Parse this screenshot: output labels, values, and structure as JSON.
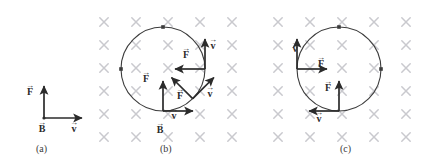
{
  "figure": {
    "colors": {
      "field_mark": "#c9c9ce",
      "vector": "#2b2b2b",
      "circle": "#3c3c3c",
      "caption": "#3a3a3a",
      "background": "#ffffff"
    },
    "field_symbol": "field-into-page-x",
    "grid": {
      "cols_x": [
        104,
        136,
        168,
        200,
        232,
        278,
        310,
        342,
        374,
        406
      ],
      "rows_y": [
        22,
        45,
        68,
        91,
        114,
        137
      ]
    }
  },
  "panels": [
    {
      "id": "a",
      "caption": "(a)",
      "caption_x": 36,
      "caption_y": 143,
      "has_field": false,
      "has_circle": false,
      "vectors": [
        {
          "name": "force-vector",
          "symbol": "F",
          "dir": "up",
          "label_x": 26,
          "label_y": 84
        },
        {
          "name": "velocity-vector",
          "symbol": "v",
          "dir": "right",
          "label_x": 70,
          "label_y": 121
        },
        {
          "name": "magnetic-field-vector",
          "symbol": "B",
          "dir": "into-page",
          "label_x": 38,
          "label_y": 121
        }
      ]
    },
    {
      "id": "b",
      "caption": "(b)",
      "caption_x": 160,
      "caption_y": 143,
      "has_field": true,
      "has_circle": true,
      "circle": {
        "cx": 163,
        "cy": 69,
        "r": 42
      },
      "field_label": {
        "symbol": "B",
        "x": 156,
        "y": 122
      },
      "positions": [
        {
          "name": "bottom-position",
          "angle_deg": 270,
          "force_dir": "up",
          "velocity_dir": "right"
        },
        {
          "name": "lower-right-position",
          "angle_deg": 315,
          "force_dir": "up-left",
          "velocity_dir": "up-right"
        },
        {
          "name": "right-position",
          "angle_deg": 0,
          "force_dir": "left",
          "velocity_dir": "up"
        }
      ],
      "labels": [
        {
          "symbol": "F",
          "x": 142,
          "y": 71
        },
        {
          "symbol": "v",
          "x": 170,
          "y": 108
        },
        {
          "symbol": "F",
          "x": 176,
          "y": 88
        },
        {
          "symbol": "v",
          "x": 206,
          "y": 86
        },
        {
          "symbol": "F",
          "x": 182,
          "y": 47
        },
        {
          "symbol": "v",
          "x": 209,
          "y": 38
        }
      ]
    },
    {
      "id": "c",
      "caption": "(c)",
      "caption_x": 340,
      "caption_y": 143,
      "has_field": true,
      "has_circle": true,
      "circle": {
        "cx": 339,
        "cy": 69,
        "r": 42
      },
      "positions": [
        {
          "name": "bottom-position",
          "angle_deg": 270,
          "force_dir": "up",
          "velocity_dir": "left"
        },
        {
          "name": "left-position",
          "angle_deg": 180,
          "force_dir": "right",
          "velocity_dir": "up"
        }
      ],
      "labels": [
        {
          "symbol": "v",
          "x": 291,
          "y": 41
        },
        {
          "symbol": "F",
          "x": 317,
          "y": 56
        },
        {
          "symbol": "F",
          "x": 324,
          "y": 80
        },
        {
          "symbol": "v",
          "x": 315,
          "y": 111
        }
      ]
    }
  ]
}
